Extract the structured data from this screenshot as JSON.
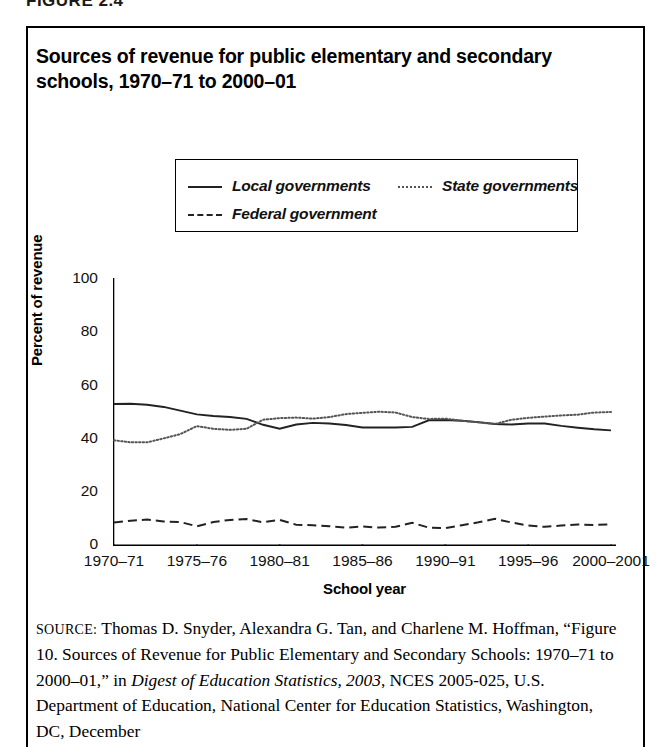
{
  "figure_caption": "FIGURE 2.4",
  "title": "Sources of revenue for public elementary and secondary schools, 1970–71 to 2000–01",
  "legend": {
    "local_label": "Local governments",
    "state_label": "State governments",
    "federal_label": "Federal government"
  },
  "axes": {
    "ylabel": "Percent of revenue",
    "xlabel": "School year"
  },
  "source": {
    "prefix": "SOURCE:",
    "line_plain_1": " Thomas D. Snyder, Alexandra G. Tan, and Charlene M. Hoffman, “Figure 10. Sources of Revenue for Public Elementary and Secondary Schools: 1970–71 to 2000–01,” in ",
    "italic_1": "Digest of Education Statistics, 2003",
    "line_plain_2": ", NCES 2005-025, U.S. Department of Education, National Center for Education Statistics, Washington, DC, December"
  },
  "colors": {
    "ink": "#000000",
    "local_line": "#222222",
    "state_line": "#555555",
    "federal_line": "#222222",
    "background": "#ffffff"
  },
  "chart_data": {
    "type": "line",
    "title": "Sources of revenue for public elementary and secondary schools, 1970–71 to 2000–01",
    "xlabel": "School year",
    "ylabel": "Percent of revenue",
    "ylim": [
      0,
      100
    ],
    "yticks": [
      0,
      20,
      40,
      60,
      80,
      100
    ],
    "grid": false,
    "legend_position": "above-plot",
    "xtick_labels": [
      "1970–71",
      "1975–76",
      "1980–81",
      "1985–86",
      "1990–91",
      "1995–96",
      "2000–2001"
    ],
    "x": [
      "1970-71",
      "1971-72",
      "1972-73",
      "1973-74",
      "1974-75",
      "1975-76",
      "1976-77",
      "1977-78",
      "1978-79",
      "1979-80",
      "1980-81",
      "1981-82",
      "1982-83",
      "1983-84",
      "1984-85",
      "1985-86",
      "1986-87",
      "1987-88",
      "1988-89",
      "1989-90",
      "1990-91",
      "1991-92",
      "1992-93",
      "1993-94",
      "1994-95",
      "1995-96",
      "1996-97",
      "1997-98",
      "1998-99",
      "1999-2000",
      "2000-2001"
    ],
    "series": [
      {
        "name": "Local governments",
        "style": "solid",
        "values": [
          52.7,
          52.8,
          52.4,
          51.6,
          50.2,
          48.8,
          48.2,
          47.8,
          47.1,
          44.9,
          43.4,
          45.0,
          45.6,
          45.4,
          44.8,
          43.9,
          43.9,
          43.9,
          44.1,
          46.6,
          46.7,
          46.4,
          45.9,
          45.2,
          45.0,
          45.4,
          45.4,
          44.5,
          43.8,
          43.2,
          42.8
        ],
        "start_value": 52.7,
        "end_value": 42.8
      },
      {
        "name": "State governments",
        "style": "dotted",
        "values": [
          39.1,
          38.3,
          38.3,
          39.8,
          41.4,
          44.4,
          43.4,
          43.0,
          43.4,
          46.8,
          47.4,
          47.6,
          47.2,
          47.8,
          48.9,
          49.4,
          49.8,
          49.5,
          47.8,
          47.1,
          47.2,
          46.4,
          45.8,
          45.2,
          46.8,
          47.5,
          48.0,
          48.4,
          48.7,
          49.5,
          49.7
        ],
        "start_value": 39.1,
        "end_value": 49.7
      },
      {
        "name": "Federal government",
        "style": "dashed",
        "values": [
          8.2,
          8.9,
          9.3,
          8.6,
          8.4,
          6.8,
          8.4,
          9.2,
          9.5,
          8.3,
          9.2,
          7.4,
          7.2,
          6.8,
          6.3,
          6.7,
          6.3,
          6.6,
          8.1,
          6.3,
          6.1,
          7.2,
          8.3,
          9.6,
          8.2,
          7.1,
          6.6,
          7.1,
          7.5,
          7.3,
          7.5
        ],
        "start_value": 8.2,
        "end_value": 7.5
      }
    ],
    "annotations": [
      "Local and state lines cross around 1978–79 and again in the early 1990s",
      "Federal share remains near 6–10 percent throughout"
    ]
  }
}
